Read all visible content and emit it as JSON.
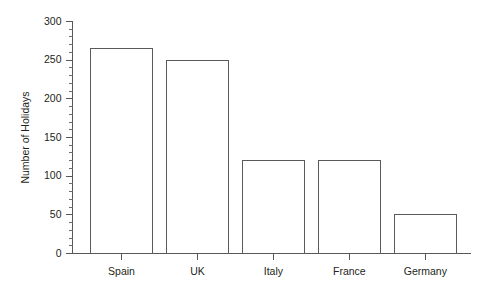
{
  "chart_data": {
    "type": "bar",
    "title": "",
    "subtitle": "",
    "xlabel": "",
    "ylabel": "Number of Holidays",
    "categories": [
      "Spain",
      "UK",
      "Italy",
      "France",
      "Germany"
    ],
    "values": [
      265,
      250,
      120,
      120,
      50
    ],
    "series": [
      {
        "name": "Number of Holidays",
        "values": [
          265,
          250,
          120,
          120,
          50
        ]
      }
    ],
    "ylim": [
      0,
      300
    ],
    "y_major_ticks": [
      0,
      50,
      100,
      150,
      200,
      250,
      300
    ],
    "y_major_tick_labels": [
      "0",
      "50",
      "100",
      "150",
      "200",
      "250",
      "300"
    ],
    "y_minor_tick_interval": 10,
    "grid": false,
    "legend": false,
    "legend_position": "none",
    "bar_fill_color": "#ffffff",
    "bar_edge_color": "#5a5a5c",
    "axis_color": "#58585a",
    "text_color": "#231f20",
    "background_color": "#ffffff"
  }
}
